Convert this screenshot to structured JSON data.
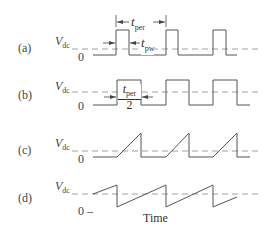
{
  "figure": {
    "panels": [
      {
        "id": "a",
        "label": "(a)",
        "type": "pulse-train",
        "vref_label": "V",
        "vref_sub": "dc",
        "zero_label": "0"
      },
      {
        "id": "b",
        "label": "(b)",
        "type": "square-wave",
        "vref_label": "V",
        "vref_sub": "dc",
        "zero_label": "0"
      },
      {
        "id": "c",
        "label": "(c)",
        "type": "ramp-pulses",
        "vref_label": "V",
        "vref_sub": "dc",
        "zero_label": "0"
      },
      {
        "id": "d",
        "label": "(d)",
        "type": "sawtooth",
        "vref_label": "V",
        "vref_sub": "dc",
        "zero_label": "0 –"
      }
    ],
    "annotations": {
      "period": {
        "symbol": "t",
        "sub": "per"
      },
      "pulse_width": {
        "symbol": "t",
        "sub": "pw"
      },
      "half_period": {
        "symbol": "t",
        "sub": "per",
        "denominator": "2"
      }
    },
    "x_axis_label": "Time",
    "colors": {
      "waveform": "#555555",
      "dashed_reference": "#888888",
      "text": "#333333"
    }
  }
}
